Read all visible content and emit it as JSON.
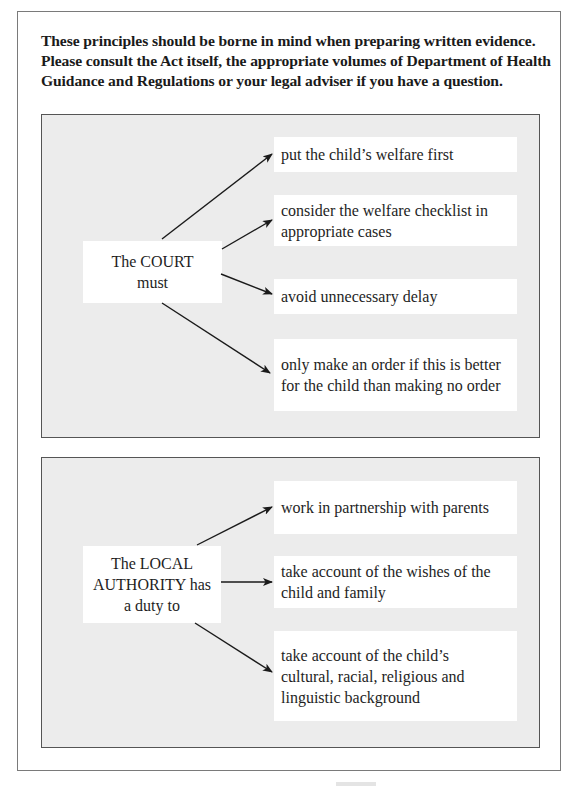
{
  "intro": {
    "lines": [
      "These principles should be borne in mind when preparing written evidence.",
      "Please consult the Act itself, the appropriate volumes of Department of Health",
      "Guidance and Regulations or your legal adviser if you have a question."
    ]
  },
  "court": {
    "label_lines": [
      "The COURT",
      "must"
    ],
    "items": [
      {
        "lines": [
          "put the child’s welfare first"
        ]
      },
      {
        "lines": [
          "consider the welfare checklist in",
          "appropriate cases"
        ]
      },
      {
        "lines": [
          "avoid unnecessary delay"
        ]
      },
      {
        "lines": [
          "only make an order if this is better",
          "for the child than making no order"
        ]
      }
    ]
  },
  "local_authority": {
    "label_lines": [
      "The LOCAL",
      "AUTHORITY has",
      "a duty to"
    ],
    "items": [
      {
        "lines": [
          "work in partnership with parents"
        ]
      },
      {
        "lines": [
          "take account of the wishes of the",
          "child and family"
        ]
      },
      {
        "lines": [
          "take account of the child’s",
          "cultural, racial, religious and",
          "linguistic background"
        ]
      }
    ]
  },
  "colors": {
    "panel_background": "#ececec",
    "box_background": "#ffffff",
    "text": "#1e1e1e",
    "arrow": "#1a1a1a"
  }
}
